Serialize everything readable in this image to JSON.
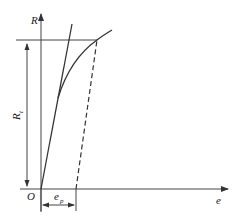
{
  "diagram": {
    "type": "stress-strain curve with offset yield",
    "axes": {
      "y_label": "R",
      "x_label": "e",
      "origin_label": "O"
    },
    "annotations": {
      "yield_strength_label": "R",
      "yield_strength_subscript": "t",
      "offset_strain_label": "e",
      "offset_strain_subscript": "p"
    },
    "elements": [
      "elastic line from origin",
      "stress-strain curve",
      "dashed offset line parallel to elastic line",
      "horizontal line at yield stress level",
      "double arrow dimension for Rt",
      "double arrow dimension for ep"
    ],
    "colors": {
      "line": "#333333",
      "background": "#ffffff"
    }
  }
}
